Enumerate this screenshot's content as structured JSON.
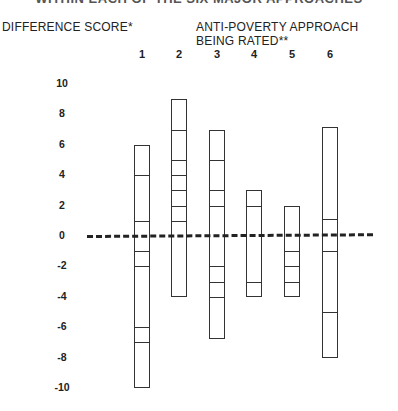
{
  "chart_data": {
    "type": "bar",
    "subtype": "floating-range-bars-with-segment-marks",
    "title": "WITHIN EACH OF THE SIX MAJOR APPROACHES",
    "title_note": "title partially cropped at top edge",
    "ylabel": "DIFFERENCE SCORE*",
    "xlabel": "ANTI-POVERTY APPROACH BEING RATED**",
    "categories": [
      "1",
      "2",
      "3",
      "4",
      "5",
      "6"
    ],
    "yticks": [
      10,
      8,
      6,
      4,
      2,
      0,
      -2,
      -4,
      -6,
      -8,
      -10
    ],
    "ylim": [
      -10,
      10
    ],
    "reference_line": {
      "value": 0,
      "style": "dashed"
    },
    "grid": false,
    "legend": null,
    "series": [
      {
        "name": "1",
        "max": 6,
        "min": -10,
        "segment_marks": [
          4,
          1,
          -1,
          -2,
          -6,
          -7
        ]
      },
      {
        "name": "2",
        "max": 9,
        "min": -4,
        "segment_marks": [
          7,
          5,
          4,
          3,
          2,
          1
        ]
      },
      {
        "name": "3",
        "max": 7,
        "min": -6.8,
        "segment_marks": [
          5,
          3,
          2,
          -2,
          -3,
          -4
        ]
      },
      {
        "name": "4",
        "max": 3,
        "min": -4,
        "segment_marks": [
          2,
          -3
        ]
      },
      {
        "name": "5",
        "max": 2,
        "min": -4,
        "segment_marks": [
          -1,
          -2,
          -3
        ]
      },
      {
        "name": "6",
        "max": 7.2,
        "min": -8,
        "segment_marks": [
          1.1,
          -1,
          -5
        ]
      }
    ]
  },
  "labels": {
    "title": "WITHIN EACH OF THE SIX MAJOR APPROACHES",
    "ylabel": "DIFFERENCE SCORE*",
    "xlabel": "ANTI-POVERTY APPROACH BEING RATED**"
  },
  "layout": {
    "zero_y": 236,
    "px_per_unit": 15.2,
    "bar_width": 16,
    "category_x": [
      142,
      179,
      217,
      254,
      292,
      330
    ]
  }
}
